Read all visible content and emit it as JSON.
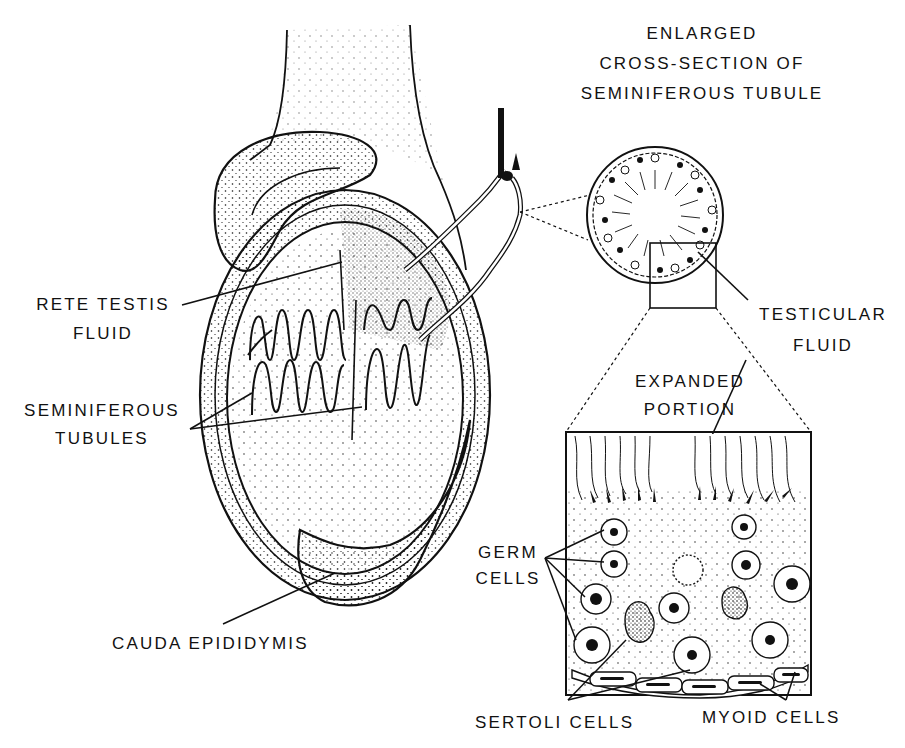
{
  "figure": {
    "colors": {
      "ink": "#111111",
      "paper": "#ffffff"
    }
  },
  "labels": {
    "cross_section_title": [
      "ENLARGED",
      "CROSS-SECTION OF",
      "SEMINIFEROUS TUBULE"
    ],
    "rete_testis_fluid": [
      "RETE TESTIS",
      "FLUID"
    ],
    "seminiferous_tubules": [
      "SEMINIFEROUS",
      "TUBULES"
    ],
    "testicular_fluid": [
      "TESTICULAR",
      "FLUID"
    ],
    "expanded_portion": [
      "EXPANDED",
      "PORTION"
    ],
    "germ_cells": [
      "GERM",
      "CELLS"
    ],
    "cauda_epididymis": "CAUDA EPIDIDYMIS",
    "sertoli_cells": "SERTOLI CELLS",
    "myoid_cells": "MYOID CELLS"
  }
}
